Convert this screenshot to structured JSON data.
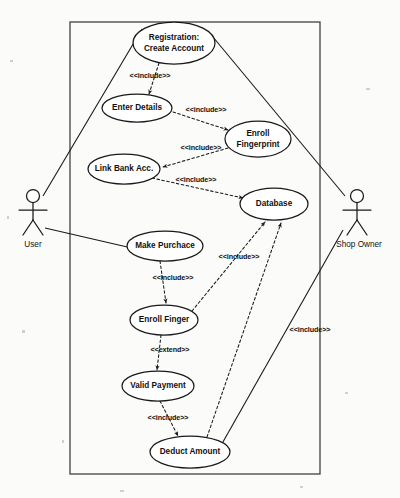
{
  "diagram": {
    "type": "uml-use-case-diagram",
    "background_color": "#fbfbfa",
    "line_color": "#1a1a1a"
  },
  "system_boundary": {
    "label": "",
    "x": 70,
    "y": 22,
    "width": 250,
    "height": 452
  },
  "actors": [
    {
      "id": "user",
      "label": "User",
      "x": 33,
      "y": 205
    },
    {
      "id": "shop_owner",
      "label": "Shop Owner",
      "x": 357,
      "y": 205
    }
  ],
  "use_cases": [
    {
      "id": "registration",
      "lines": [
        "Registration:",
        "Create Account"
      ],
      "cx": 174,
      "cy": 43,
      "rx": 41,
      "ry": 21
    },
    {
      "id": "enter_details",
      "lines": [
        "Enter Details"
      ],
      "cx": 137,
      "cy": 108,
      "rx": 35,
      "ry": 14
    },
    {
      "id": "enroll_fingerprint",
      "lines": [
        "Enroll",
        "Fingerprint"
      ],
      "cx": 258,
      "cy": 139,
      "rx": 33,
      "ry": 18
    },
    {
      "id": "link_bank_acc",
      "lines": [
        "Link Bank Acc."
      ],
      "cx": 124,
      "cy": 169,
      "rx": 36,
      "ry": 15
    },
    {
      "id": "database",
      "lines": [
        "Database"
      ],
      "cx": 274,
      "cy": 204,
      "rx": 34,
      "ry": 16
    },
    {
      "id": "make_purchace",
      "lines": [
        "Make Purchace"
      ],
      "cx": 165,
      "cy": 246,
      "rx": 38,
      "ry": 15
    },
    {
      "id": "enroll_finger",
      "lines": [
        "Enroll Finger"
      ],
      "cx": 164,
      "cy": 320,
      "rx": 34,
      "ry": 15
    },
    {
      "id": "valid_payment",
      "lines": [
        "Valid Payment"
      ],
      "cx": 158,
      "cy": 386,
      "rx": 36,
      "ry": 15
    },
    {
      "id": "deduct_amount",
      "lines": [
        "Deduct Amount"
      ],
      "cx": 190,
      "cy": 452,
      "rx": 40,
      "ry": 16
    }
  ],
  "relationships": [
    {
      "id": "rel-reg-enter",
      "from": "registration",
      "to": "enter_details",
      "stereotype": "<<include>>",
      "kind": "include",
      "label_x": 150,
      "label_y": 76
    },
    {
      "id": "rel-enter-enroll-fp",
      "from": "enter_details",
      "to": "enroll_fingerprint",
      "stereotype": "<<include>>",
      "kind": "include",
      "label_x": 206,
      "label_y": 110
    },
    {
      "id": "rel-enrollfp-linkbank",
      "from": "enroll_fingerprint",
      "to": "link_bank_acc",
      "stereotype": "<<include>>",
      "kind": "include",
      "label_x": 201,
      "label_y": 148
    },
    {
      "id": "rel-linkbank-db",
      "from": "link_bank_acc",
      "to": "database",
      "stereotype": "<<include>>",
      "kind": "include",
      "label_x": 196,
      "label_y": 180
    },
    {
      "id": "rel-purchase-enroll",
      "from": "make_purchace",
      "to": "enroll_finger",
      "stereotype": "<<include>>",
      "kind": "include",
      "label_x": 173,
      "label_y": 278
    },
    {
      "id": "rel-enroll-db",
      "from": "enroll_finger",
      "to": "database",
      "stereotype": "<<include>>",
      "kind": "include",
      "label_x": 239,
      "label_y": 257
    },
    {
      "id": "rel-enroll-valid",
      "from": "enroll_finger",
      "to": "valid_payment",
      "stereotype": "<<extend>>",
      "kind": "extend",
      "label_x": 170,
      "label_y": 350
    },
    {
      "id": "rel-valid-deduct",
      "from": "valid_payment",
      "to": "deduct_amount",
      "stereotype": "<<include>>",
      "kind": "include",
      "label_x": 168,
      "label_y": 418
    },
    {
      "id": "rel-deduct-db",
      "from": "deduct_amount",
      "to": "database",
      "stereotype": "<<include>>",
      "kind": "include",
      "label_x": 310,
      "label_y": 330
    }
  ],
  "associations": [
    {
      "id": "assoc-user-registration",
      "actor": "user",
      "use_case": "registration"
    },
    {
      "id": "assoc-user-purchase",
      "actor": "user",
      "use_case": "make_purchace"
    },
    {
      "id": "assoc-owner-registration",
      "actor": "shop_owner",
      "use_case": "registration"
    },
    {
      "id": "assoc-owner-deduct",
      "actor": "shop_owner",
      "use_case": "deduct_amount"
    }
  ]
}
